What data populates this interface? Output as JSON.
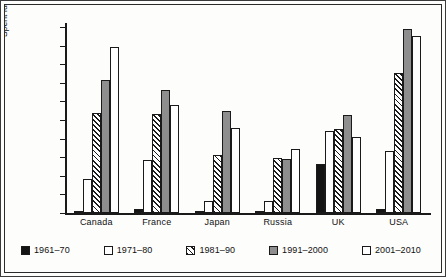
{
  "chart_data": {
    "type": "bar",
    "title": "",
    "xlabel": "",
    "ylabel": "Spent fuel (tonnes)",
    "ylim": [
      0,
      20000
    ],
    "ytick_step": 2000,
    "ytick_labels": [
      "20 000",
      "18 000",
      "16 000",
      "14 000",
      "12 000",
      "10 000",
      "8 000",
      "6 000",
      "4 000",
      "2 000",
      "0"
    ],
    "ytick_values": [
      20000,
      18000,
      16000,
      14000,
      12000,
      10000,
      8000,
      6000,
      4000,
      2000,
      0
    ],
    "grid": false,
    "legend_position": "bottom",
    "categories": [
      "Canada",
      "France",
      "Japan",
      "Russia",
      "UK",
      "USA"
    ],
    "series": [
      {
        "name": "1961–70",
        "fill": "black",
        "values": [
          0,
          400,
          200,
          250,
          5250,
          400
        ]
      },
      {
        "name": "1971–80",
        "fill": "white",
        "values": [
          3700,
          5650,
          1250,
          1250,
          8800,
          6650
        ]
      },
      {
        "name": "1981–90",
        "fill": "hatch",
        "values": [
          10800,
          10600,
          6250,
          5900,
          9050,
          15100
        ]
      },
      {
        "name": "1991–2000",
        "fill": "gray",
        "values": [
          14300,
          13250,
          11000,
          5850,
          10500,
          19750
        ]
      },
      {
        "name": "2001–2010",
        "fill": "white",
        "values": [
          17900,
          11600,
          9100,
          6900,
          8200,
          19000
        ]
      }
    ]
  },
  "colors": {
    "black": "#141414",
    "white": "#fefefe",
    "gray": "#8e8e8e",
    "hatch_line": "#1a1a1a",
    "axis": "#1a1a1a",
    "background": "#fdfdfc"
  }
}
